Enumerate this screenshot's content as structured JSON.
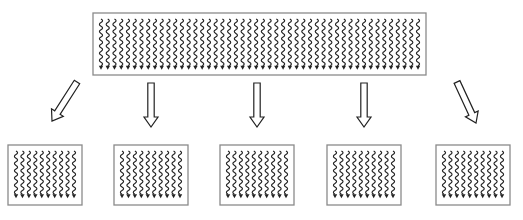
{
  "diagram": {
    "type": "split-diagram",
    "source": {
      "label": "",
      "strand_count": 48,
      "strand_icon": "wavy-arrow-down"
    },
    "arrows": [
      {
        "direction": "down-left"
      },
      {
        "direction": "down"
      },
      {
        "direction": "down"
      },
      {
        "direction": "down"
      },
      {
        "direction": "down-right"
      }
    ],
    "targets": [
      {
        "label": "",
        "strand_count": 10
      },
      {
        "label": "",
        "strand_count": 10
      },
      {
        "label": "",
        "strand_count": 10
      },
      {
        "label": "",
        "strand_count": 10
      },
      {
        "label": "",
        "strand_count": 10
      }
    ],
    "colors": {
      "box_border": "#8a8a8a",
      "strand": "#222222",
      "arrow_outline": "#222222",
      "background": "#ffffff"
    }
  }
}
